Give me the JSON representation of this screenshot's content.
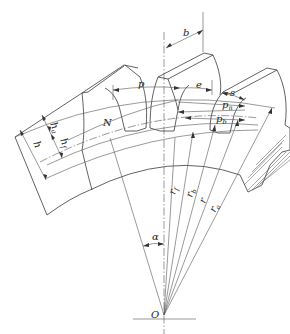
{
  "diagram": {
    "type": "gear-nomenclature",
    "labels": {
      "face_width": "b",
      "pitch": "p",
      "space_width": "e",
      "tooth_thickness": "s",
      "normal_pitch": "pn",
      "base_pitch": "pb",
      "addendum": "ha",
      "dedendum": "hf",
      "whole_depth": "h",
      "line_of_action": "N",
      "root_radius": "rf",
      "base_radius": "rb",
      "pitch_radius": "r",
      "tip_radius": "ra",
      "pressure_angle": "α",
      "center": "O"
    },
    "label_parts": {
      "pn": {
        "main": "p",
        "sub": "n"
      },
      "pb": {
        "main": "p",
        "sub": "b"
      },
      "ha": {
        "main": "h",
        "sub": "a"
      },
      "hf": {
        "main": "h",
        "sub": "f"
      },
      "rf": {
        "main": "r",
        "sub": "f"
      },
      "rb": {
        "main": "r",
        "sub": "b"
      },
      "ra": {
        "main": "r",
        "sub": "a"
      }
    },
    "colors": {
      "line": "#3a3a3a",
      "background": "#ffffff"
    }
  }
}
